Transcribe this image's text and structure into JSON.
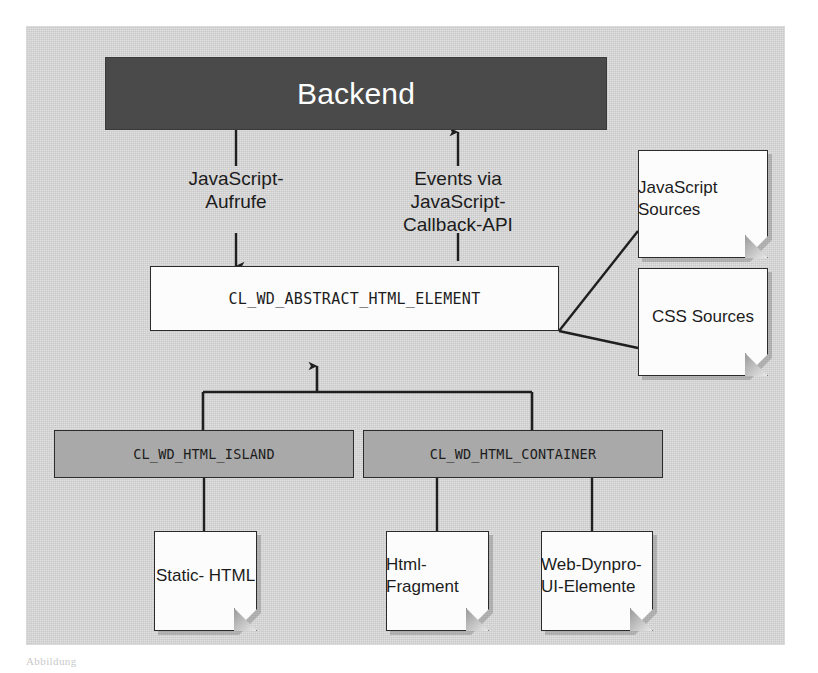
{
  "figure": {
    "background_color": "#d4d4d4",
    "caption": "Abbildung"
  },
  "backend": {
    "label": "Backend",
    "fill_color": "#4a4a4a",
    "text_color": "#ffffff"
  },
  "edges": {
    "down_label": "JavaScript-\nAufrufe",
    "up_label": "Events via\nJavaScript-\nCallback-API"
  },
  "abstract_class": {
    "label": "CL_WD_ABSTRACT_HTML_ELEMENT",
    "fill_color": "#fcfcfc"
  },
  "resources": [
    {
      "label": "JavaScript\nSources"
    },
    {
      "label": "CSS\nSources"
    }
  ],
  "subclasses": [
    {
      "label": "CL_WD_HTML_ISLAND",
      "fill_color": "#a9a9a9"
    },
    {
      "label": "CL_WD_HTML_CONTAINER",
      "fill_color": "#a9a9a9"
    }
  ],
  "contents": [
    {
      "label": "Static-\nHTML"
    },
    {
      "label": "Html-\nFragment"
    },
    {
      "label": "Web-Dynpro-\nUI-Elemente"
    }
  ]
}
